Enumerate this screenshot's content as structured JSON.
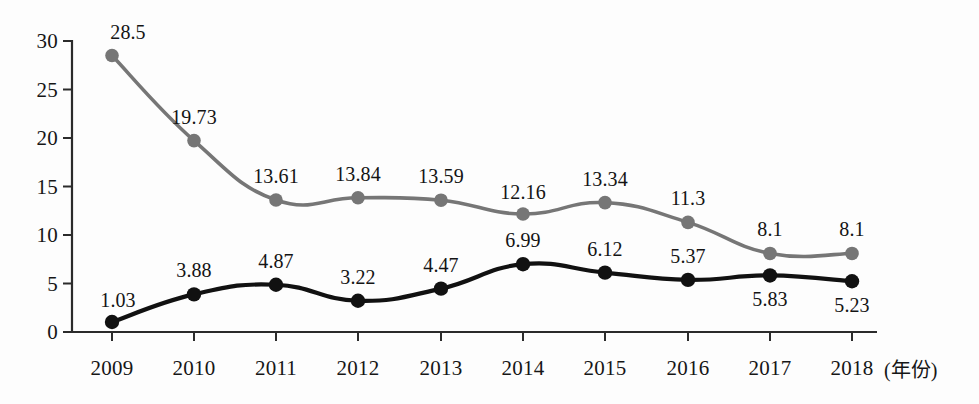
{
  "chart_data": {
    "type": "line",
    "title": "",
    "xlabel": "(年份)",
    "ylabel": "",
    "x": [
      "2009",
      "2010",
      "2011",
      "2012",
      "2013",
      "2014",
      "2015",
      "2016",
      "2017",
      "2018"
    ],
    "categories": [
      "2009",
      "2010",
      "2011",
      "2012",
      "2013",
      "2014",
      "2015",
      "2016",
      "2017",
      "2018"
    ],
    "ylim": [
      0,
      30
    ],
    "yticks": [
      0,
      5,
      10,
      15,
      20,
      25,
      30
    ],
    "ytick_labels": [
      "0",
      "5",
      "10",
      "15",
      "20",
      "25",
      "30"
    ],
    "grid": false,
    "legend": "none",
    "series": [
      {
        "name": "gray-series",
        "color": "#767676",
        "marker": "circle",
        "values": [
          28.5,
          19.73,
          13.61,
          13.84,
          13.59,
          12.16,
          13.34,
          11.3,
          8.1,
          8.1
        ],
        "labels": [
          "28.5",
          "19.73",
          "13.61",
          "13.84",
          "13.59",
          "12.16",
          "13.34",
          "11.3",
          "8.1",
          "8.1"
        ],
        "label_position": "above"
      },
      {
        "name": "black-series",
        "color": "#111111",
        "marker": "circle",
        "values": [
          1.03,
          3.88,
          4.87,
          3.22,
          4.47,
          6.99,
          6.12,
          5.37,
          5.83,
          5.23
        ],
        "labels": [
          "1.03",
          "3.88",
          "4.87",
          "3.22",
          "4.47",
          "6.99",
          "6.12",
          "5.37",
          "5.83",
          "5.23"
        ],
        "label_position": [
          "above",
          "above",
          "above",
          "above",
          "above",
          "above",
          "above",
          "above",
          "below",
          "below"
        ]
      }
    ]
  },
  "axes": {
    "x_unit_label": "(年份)"
  },
  "geometry": {
    "x_positions": [
      112,
      194,
      276,
      358,
      441,
      523,
      605,
      688,
      770,
      852
    ],
    "y_baseline": 332,
    "y_per_unit": 9.7,
    "axis_x": 72,
    "axis_right": 877,
    "axis_top": 41
  }
}
